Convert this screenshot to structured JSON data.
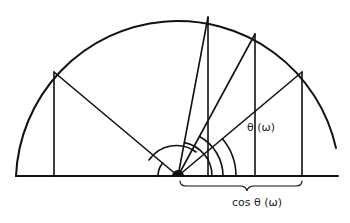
{
  "diagram": {
    "labels": {
      "theta": "θ (ω)",
      "cos_theta": "cos θ (ω)"
    },
    "center": [
      178,
      176
    ],
    "radius": 162,
    "points_on_arc": [
      [
        54,
        72
      ],
      [
        208,
        17
      ],
      [
        255,
        34
      ],
      [
        302,
        72
      ]
    ],
    "angle_arc_radii": [
      20,
      34,
      45,
      58
    ],
    "colors": {
      "stroke": "#111111",
      "background": "#ffffff"
    }
  }
}
